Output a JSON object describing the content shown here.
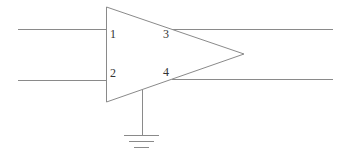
{
  "diagram": {
    "type": "amplifier-symbol",
    "colors": {
      "line": "#8a8a8a",
      "text": "#333333",
      "background": "#ffffff"
    },
    "triangle": {
      "points": [
        [
          106,
          7
        ],
        [
          106,
          102
        ],
        [
          244,
          54
        ]
      ]
    },
    "pins": [
      {
        "id": "1",
        "label": "1",
        "x": 110,
        "y": 38
      },
      {
        "id": "2",
        "label": "2",
        "x": 110,
        "y": 76
      },
      {
        "id": "3",
        "label": "3",
        "x": 163,
        "y": 38
      },
      {
        "id": "4",
        "label": "4",
        "x": 163,
        "y": 76
      }
    ],
    "wires": [
      {
        "name": "input-wire-1",
        "x1": 18,
        "y1": 29,
        "x2": 106,
        "y2": 29
      },
      {
        "name": "input-wire-2",
        "x1": 18,
        "y1": 80,
        "x2": 106,
        "y2": 80
      },
      {
        "name": "output-wire-3",
        "x1": 172,
        "y1": 29,
        "x2": 333,
        "y2": 29
      },
      {
        "name": "output-wire-4",
        "x1": 172,
        "y1": 79,
        "x2": 333,
        "y2": 79
      },
      {
        "name": "ground-wire",
        "x1": 142,
        "y1": 90,
        "x2": 142,
        "y2": 135
      }
    ],
    "ground": {
      "bars": [
        {
          "x1": 124,
          "x2": 159,
          "y": 135
        },
        {
          "x1": 129,
          "x2": 154,
          "y": 141
        },
        {
          "x1": 134,
          "x2": 149,
          "y": 147
        }
      ]
    }
  }
}
